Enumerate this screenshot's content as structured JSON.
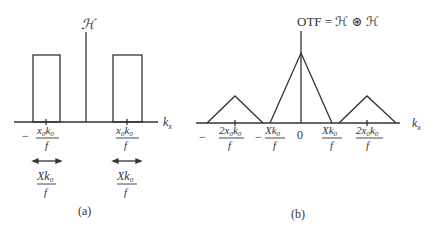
{
  "panel_a": {
    "caption": "(a)",
    "top_label": "ℋ",
    "axis_label": "k",
    "axis_sub": "x",
    "left_tick": {
      "sign": "−",
      "num": "x",
      "num_sub": "0",
      "num2": "k",
      "num2_sub": "0",
      "den": "f"
    },
    "right_tick": {
      "num": "x",
      "num_sub": "0",
      "num2": "k",
      "num2_sub": "0",
      "den": "f"
    },
    "left_width": {
      "num": "Xk",
      "num_sub": "0",
      "den": "f"
    },
    "right_width": {
      "num": "Xk",
      "num_sub": "0",
      "den": "f"
    }
  },
  "panel_b": {
    "caption": "(b)",
    "top_label": "OTF  =  ℋ ⊛ ℋ",
    "axis_label": "k",
    "axis_sub": "x",
    "ticks": [
      {
        "sign": "−",
        "num": "2x",
        "num_sub": "0",
        "num2": "k",
        "num2_sub": "0",
        "den": "f"
      },
      {
        "sign": "−",
        "num": "Xk",
        "num_sub": "0",
        "den": "f"
      },
      {
        "label": "0"
      },
      {
        "num": "Xk",
        "num_sub": "0",
        "den": "f"
      },
      {
        "num": "2x",
        "num_sub": "0",
        "num2": "k",
        "num2_sub": "0",
        "den": "f"
      }
    ]
  }
}
